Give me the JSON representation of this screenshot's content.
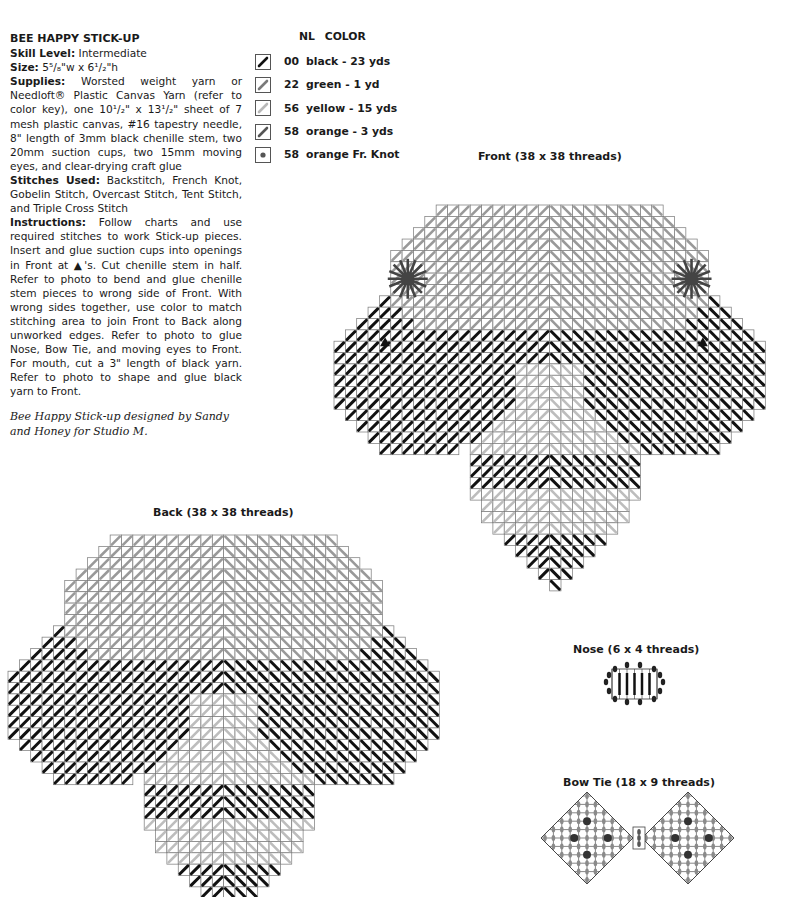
{
  "pattern": {
    "title": "BEE HAPPY STICK-UP",
    "skill_label": "Skill Level:",
    "skill_value": "Intermediate",
    "size_label": "Size:",
    "size_value": "5⁵/₈\"w x 6¹/₂\"h",
    "supplies_label": "Supplies:",
    "supplies_value": "Worsted weight yarn or Needloft® Plastic Canvas Yarn (refer to color key), one 10¹/₂\" x 13¹/₂\" sheet of 7 mesh plastic canvas, #16 tapestry needle, 8\" length of 3mm black chenille stem, two 20mm suction cups, two 15mm moving eyes, and clear-drying craft glue",
    "stitches_label": "Stitches Used:",
    "stitches_value": "Backstitch, French Knot, Gobelin Stitch, Overcast Stitch, Tent Stitch, and Triple Cross Stitch",
    "instructions_label": "Instructions:",
    "instructions_value": "Follow charts and use required stitches to work Stick-up pieces. Insert and glue suction cups into openings in Front at ▲'s. Cut chenille stem in half. Refer to photo to bend and glue chenille stem pieces to wrong side of Front. With wrong sides together, use color to match stitching area to join Front to Back along unworked edges. Refer to photo to glue Nose, Bow Tie, and moving eyes to Front. For mouth, cut a 3\" length of black yarn. Refer to photo to shape and glue black yarn to Front.",
    "credit": "Bee Happy Stick-up designed by Sandy and Honey for Studio M."
  },
  "color_key": {
    "header_nl": "NL",
    "header_color": "COLOR",
    "items": [
      {
        "nl": "00",
        "label": "black - 23 yds",
        "type": "stroke",
        "color": "#111111"
      },
      {
        "nl": "22",
        "label": "green - 1 yd",
        "type": "stroke",
        "color": "#7a7a7a"
      },
      {
        "nl": "56",
        "label": "yellow - 15 yds",
        "type": "stroke",
        "color": "#b8b8b8"
      },
      {
        "nl": "58",
        "label": "orange - 3 yds",
        "type": "stroke",
        "color": "#555555"
      },
      {
        "nl": "58",
        "label": "orange Fr. Knot",
        "type": "knot",
        "color": "#555555"
      }
    ]
  },
  "charts": {
    "front": {
      "title": "Front (38 x 38 threads)"
    },
    "back": {
      "title": "Back (38 x 38 threads)"
    },
    "nose": {
      "title": "Nose (6 x 4 threads)"
    },
    "bowtie": {
      "title": "Bow Tie (18 x 9 threads)"
    }
  }
}
